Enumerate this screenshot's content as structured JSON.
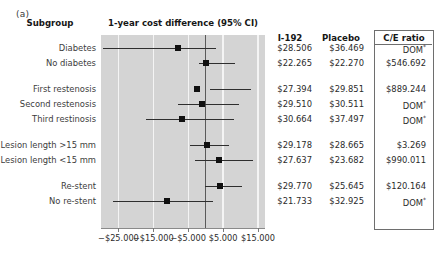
{
  "panel_label": "(a)",
  "headers": {
    "subgroup": "Subgroup",
    "plot_title": "1-year cost difference (95% CI)",
    "col_i192": "I-192",
    "col_placebo": "Placebo",
    "col_ce_ratio": "C/E ratio"
  },
  "axis": {
    "ticks": [
      "−$25.000",
      "−$15.000",
      "−$5.000",
      "$5.000",
      "$15.000"
    ],
    "tick_values": [
      -25000,
      -15000,
      -5000,
      5000,
      15000
    ],
    "xlim": [
      -30000,
      17000
    ],
    "zero_value": 0
  },
  "colors": {
    "plot_background": "#d4d4d4",
    "gridline": "#f4f4f4",
    "zero_line": "#5a5a5a",
    "marker": "#101010",
    "text": "#2b2b2b",
    "box_border": "#6e6e6e"
  },
  "chart_data": {
    "type": "forest",
    "title": "1-year cost difference (95% CI)",
    "xlabel": "",
    "ylabel": "Subgroup",
    "xlim": [
      -30000,
      17000
    ],
    "grid": true,
    "legend": "none",
    "xticks": [
      -25000,
      -15000,
      -5000,
      5000,
      15000
    ],
    "xticklabels": [
      "−$25.000",
      "−$15.000",
      "−$5.000",
      "$5.000",
      "$15.000"
    ],
    "columns": [
      "Subgroup",
      "I-192",
      "Placebo",
      "C/E ratio"
    ],
    "rows": [
      {
        "label": "Diabetes",
        "estimate": -7963,
        "ci_low": -29500,
        "ci_high": 3000,
        "i192": "$28.506",
        "placebo": "$36.469",
        "ce_ratio": "DOM",
        "ce_dagger": true,
        "spacer_before": false
      },
      {
        "label": "No diabetes",
        "estimate": -5,
        "ci_low": -1800,
        "ci_high": 8500,
        "i192": "$22.265",
        "placebo": "$22.270",
        "ce_ratio": "$546.692",
        "ce_dagger": false,
        "spacer_before": false
      },
      {
        "label": "First restenosis",
        "estimate": -2457,
        "ci_low": 1200,
        "ci_high": 13000,
        "i192": "$27.394",
        "placebo": "$29.851",
        "ce_ratio": "$889.244",
        "ce_dagger": false,
        "spacer_before": true
      },
      {
        "label": "Second restenosis",
        "estimate": -1001,
        "ci_low": -8000,
        "ci_high": 9500,
        "i192": "$29.510",
        "placebo": "$30.511",
        "ce_ratio": "DOM",
        "ce_dagger": true,
        "spacer_before": false
      },
      {
        "label": "Third restinosis",
        "estimate": -6833,
        "ci_low": -17000,
        "ci_high": 8000,
        "i192": "$30.664",
        "placebo": "$37.497",
        "ce_ratio": "DOM",
        "ce_dagger": true,
        "spacer_before": false
      },
      {
        "label": "Lesion length >15 mm",
        "estimate": 513,
        "ci_low": -4600,
        "ci_high": 6800,
        "i192": "$29.178",
        "placebo": "$28.665",
        "ce_ratio": "$3.269",
        "ce_dagger": false,
        "spacer_before": true
      },
      {
        "label": "Lesion length <15 mm",
        "estimate": 3955,
        "ci_low": -3200,
        "ci_high": 13500,
        "i192": "$27.637",
        "placebo": "$23.682",
        "ce_ratio": "$990.011",
        "ce_dagger": false,
        "spacer_before": false
      },
      {
        "label": "Re-stent",
        "estimate": 4125,
        "ci_low": -200,
        "ci_high": 10500,
        "i192": "$29.770",
        "placebo": "$25.645",
        "ce_ratio": "$120.164",
        "ce_dagger": false,
        "spacer_before": true
      },
      {
        "label": "No re-stent",
        "estimate": -11192,
        "ci_low": -26500,
        "ci_high": 2200,
        "i192": "$21.733",
        "placebo": "$32.925",
        "ce_ratio": "DOM",
        "ce_dagger": true,
        "spacer_before": false
      }
    ]
  },
  "layout": {
    "plot_left": 101,
    "plot_top": 35,
    "plot_width": 164,
    "plot_height": 193,
    "row_start_y": 48,
    "row_step": 15,
    "group_gap": 11
  }
}
